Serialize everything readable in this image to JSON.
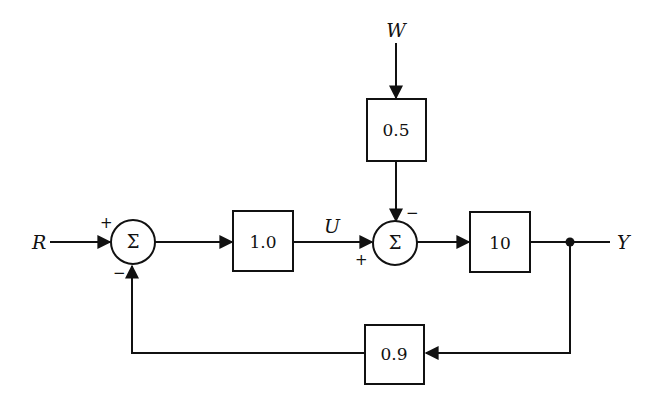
{
  "diagram": {
    "type": "feedback-control-block-diagram",
    "signals": {
      "reference": "R",
      "disturbance": "W",
      "control": "U",
      "output": "Y"
    },
    "summing_junctions": [
      {
        "id": "sum1",
        "symbol": "Σ",
        "signs": {
          "reference_input": "+",
          "feedback_input": "−"
        }
      },
      {
        "id": "sum2",
        "symbol": "Σ",
        "signs": {
          "control_input": "+",
          "disturbance_input": "−"
        }
      }
    ],
    "blocks": [
      {
        "id": "controller",
        "gain": "1.0"
      },
      {
        "id": "disturbance-gain",
        "gain": "0.5"
      },
      {
        "id": "plant",
        "gain": "10"
      },
      {
        "id": "sensor",
        "gain": "0.9"
      }
    ],
    "connections": [
      "R → sum1 (+)",
      "sum1 → 1.0",
      "1.0 → U → sum2 (+)",
      "W → 0.5 → sum2 (−)",
      "sum2 → 10",
      "10 → Y",
      "Y → 0.9 → sum1 (−)"
    ]
  }
}
